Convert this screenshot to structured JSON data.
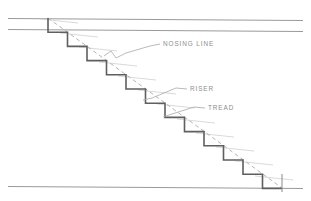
{
  "drawing": {
    "title": "Stair Section Detail",
    "type": "architectural-section",
    "canvas": {
      "width": 311,
      "height": 201
    },
    "background_color": "#ffffff",
    "colors": {
      "stair_profile": "#5f5f5f",
      "floor_line": "#9a9a9a",
      "nosing_line": "#b5b5b5",
      "tick_mark": "#c0c0c0",
      "leader_line": "#a8a8a8",
      "label_text": "#8d8d8d"
    },
    "floor_lines": [
      {
        "name": "upper-floor-line",
        "x1": 8,
        "y1": 18,
        "x2": 303,
        "y2": 20
      },
      {
        "name": "lower-floor-line",
        "x1": 8,
        "y1": 29,
        "x2": 303,
        "y2": 31
      },
      {
        "name": "ground-floor-line",
        "x1": 8,
        "y1": 186,
        "x2": 303,
        "y2": 188
      }
    ],
    "stair": {
      "step_count": 12,
      "start_x": 48,
      "start_y": 18,
      "tread_width": 19.5,
      "riser_height": 14.2,
      "nosing_start": {
        "x": 48,
        "y": 18
      },
      "nosing_end": {
        "x": 282,
        "y": 188
      }
    },
    "labels": [
      {
        "id": "nosing-line",
        "text": "NOSING LINE",
        "text_x": 163,
        "text_y": 44,
        "leader": "M160,44 L150,46 L126,53 L116,58 L111,51 L104,56",
        "leader_points": [
          [
            160,
            44
          ],
          [
            150,
            46
          ],
          [
            126,
            53
          ],
          [
            116,
            58
          ],
          [
            111,
            51
          ],
          [
            104,
            56
          ]
        ]
      },
      {
        "id": "riser",
        "text": "RISER",
        "text_x": 190,
        "text_y": 89,
        "leader": "M187,89 L176,88 L152,98 L143,100",
        "leader_points": [
          [
            187,
            89
          ],
          [
            176,
            88
          ],
          [
            152,
            98
          ],
          [
            143,
            100
          ]
        ]
      },
      {
        "id": "tread",
        "text": "TREAD",
        "text_x": 208,
        "text_y": 108,
        "leader": "M205,108 L194,107 L172,114 L163,117",
        "leader_points": [
          [
            205,
            108
          ],
          [
            194,
            107
          ],
          [
            172,
            114
          ],
          [
            163,
            117
          ]
        ]
      }
    ]
  }
}
